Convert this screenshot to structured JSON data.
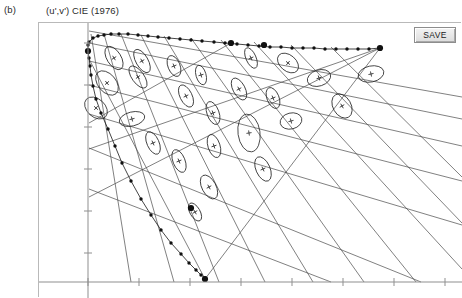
{
  "figure": {
    "panel_label": "(b)",
    "title": "(u',v') CIE (1976)"
  },
  "toolbar": {
    "save_label": "SAVE"
  },
  "colors": {
    "locus_line": "#151515",
    "locus_dot": "#101010",
    "grid_line": "#4a4a4a",
    "ellipse_line": "#2a2a2a",
    "axis_line": "#8f8f8f",
    "panel_border": "#b9b9b9",
    "background": "#ffffff"
  },
  "chart_data": {
    "type": "scatter",
    "title": "(u',v') CIE (1976)",
    "xlabel": "u'",
    "ylabel": "v'",
    "grid": true,
    "legend": null,
    "xlim": [
      0,
      1
    ],
    "ylim": [
      0,
      1
    ],
    "axes": {
      "x_axis_pixel_y": 281,
      "y_axis_pixel_x": 87,
      "x_ticks_pixel": [
        87,
        138,
        189,
        240,
        291,
        342,
        393,
        444
      ],
      "y_ticks_pixel": [
        42,
        84,
        126,
        168,
        210,
        252
      ],
      "tick_labels_visible": false
    },
    "spectral_locus": {
      "name": "Spectral locus (wavelength markers)",
      "marker": "filled-circle",
      "upper_branch_pixels": [
        [
          88,
          41
        ],
        [
          92,
          37
        ],
        [
          97,
          35
        ],
        [
          103,
          34
        ],
        [
          110,
          33
        ],
        [
          118,
          33
        ],
        [
          127,
          33
        ],
        [
          137,
          34
        ],
        [
          147,
          35
        ],
        [
          157,
          36
        ],
        [
          168,
          37
        ],
        [
          179,
          38
        ],
        [
          190,
          39
        ],
        [
          201,
          40
        ],
        [
          213,
          41
        ],
        [
          224,
          42
        ],
        [
          236,
          43
        ],
        [
          247,
          44
        ],
        [
          258,
          45
        ],
        [
          269,
          46
        ],
        [
          280,
          46
        ],
        [
          291,
          47
        ],
        [
          302,
          47
        ],
        [
          313,
          47
        ],
        [
          324,
          48
        ],
        [
          335,
          48
        ],
        [
          346,
          48
        ],
        [
          357,
          48
        ],
        [
          368,
          48
        ],
        [
          379,
          47
        ]
      ],
      "lower_branch_pixels": [
        [
          87,
          44
        ],
        [
          87,
          50
        ],
        [
          88,
          57
        ],
        [
          89,
          65
        ],
        [
          90,
          74
        ],
        [
          92,
          85
        ],
        [
          95,
          98
        ],
        [
          100,
          112
        ],
        [
          107,
          128
        ],
        [
          114,
          145
        ],
        [
          121,
          162
        ],
        [
          130,
          180
        ],
        [
          140,
          198
        ],
        [
          150,
          214
        ],
        [
          160,
          229
        ],
        [
          170,
          242
        ],
        [
          180,
          253
        ],
        [
          188,
          262
        ],
        [
          195,
          269
        ],
        [
          200,
          274
        ],
        [
          204,
          277
        ]
      ],
      "large_markers_pixels": [
        [
          87,
          50
        ],
        [
          230,
          42
        ],
        [
          263,
          44
        ],
        [
          379,
          47
        ],
        [
          204,
          278
        ],
        [
          190,
          207
        ]
      ]
    },
    "macadam_ellipses": {
      "name": "MacAdam ellipses (center + cross)",
      "count": 25,
      "items": [
        {
          "cx": 113,
          "cy": 57,
          "rx": 7,
          "ry": 13,
          "angle": -32
        },
        {
          "cx": 141,
          "cy": 60,
          "rx": 6,
          "ry": 13,
          "angle": -30
        },
        {
          "cx": 106,
          "cy": 82,
          "rx": 9,
          "ry": 14,
          "angle": -40
        },
        {
          "cx": 137,
          "cy": 76,
          "rx": 6,
          "ry": 13,
          "angle": -36
        },
        {
          "cx": 173,
          "cy": 65,
          "rx": 6,
          "ry": 11,
          "angle": -22
        },
        {
          "cx": 200,
          "cy": 74,
          "rx": 5,
          "ry": 10,
          "angle": -16
        },
        {
          "cx": 250,
          "cy": 57,
          "rx": 5,
          "ry": 11,
          "angle": -24
        },
        {
          "cx": 287,
          "cy": 62,
          "rx": 8,
          "ry": 12,
          "angle": -50
        },
        {
          "cx": 318,
          "cy": 77,
          "rx": 12,
          "ry": 8,
          "angle": -18
        },
        {
          "cx": 370,
          "cy": 73,
          "rx": 13,
          "ry": 8,
          "angle": -12
        },
        {
          "cx": 95,
          "cy": 107,
          "rx": 9,
          "ry": 13,
          "angle": -48
        },
        {
          "cx": 131,
          "cy": 118,
          "rx": 13,
          "ry": 7,
          "angle": -14
        },
        {
          "cx": 185,
          "cy": 95,
          "rx": 6,
          "ry": 12,
          "angle": -26
        },
        {
          "cx": 212,
          "cy": 112,
          "rx": 6,
          "ry": 12,
          "angle": -20
        },
        {
          "cx": 238,
          "cy": 88,
          "rx": 6,
          "ry": 12,
          "angle": -28
        },
        {
          "cx": 272,
          "cy": 97,
          "rx": 6,
          "ry": 11,
          "angle": -22
        },
        {
          "cx": 248,
          "cy": 132,
          "rx": 11,
          "ry": 19,
          "angle": -8
        },
        {
          "cx": 290,
          "cy": 120,
          "rx": 11,
          "ry": 8,
          "angle": -14
        },
        {
          "cx": 341,
          "cy": 105,
          "rx": 9,
          "ry": 13,
          "angle": -30
        },
        {
          "cx": 213,
          "cy": 145,
          "rx": 6,
          "ry": 12,
          "angle": -18
        },
        {
          "cx": 178,
          "cy": 160,
          "rx": 6,
          "ry": 12,
          "angle": -22
        },
        {
          "cx": 152,
          "cy": 142,
          "rx": 6,
          "ry": 12,
          "angle": -24
        },
        {
          "cx": 208,
          "cy": 186,
          "rx": 7,
          "ry": 13,
          "angle": -28
        },
        {
          "cx": 262,
          "cy": 168,
          "rx": 7,
          "ry": 13,
          "angle": -24
        },
        {
          "cx": 194,
          "cy": 211,
          "rx": 5,
          "ry": 10,
          "angle": -30
        }
      ]
    },
    "grid_lines": {
      "name": "Constant-hue / constant-saturation grid",
      "segments_pixels": [
        [
          [
            88,
            30
          ],
          [
            461,
            96
          ]
        ],
        [
          [
            88,
            42
          ],
          [
            461,
            118
          ]
        ],
        [
          [
            88,
            60
          ],
          [
            461,
            145
          ]
        ],
        [
          [
            88,
            84
          ],
          [
            461,
            180
          ]
        ],
        [
          [
            88,
            113
          ],
          [
            461,
            224
          ]
        ],
        [
          [
            88,
            147
          ],
          [
            420,
            281
          ]
        ],
        [
          [
            88,
            188
          ],
          [
            330,
            281
          ]
        ],
        [
          [
            90,
            33
          ],
          [
            130,
            281
          ]
        ],
        [
          [
            103,
            33
          ],
          [
            173,
            281
          ]
        ],
        [
          [
            120,
            33
          ],
          [
            218,
            281
          ]
        ],
        [
          [
            140,
            34
          ],
          [
            264,
            281
          ]
        ],
        [
          [
            163,
            35
          ],
          [
            312,
            281
          ]
        ],
        [
          [
            190,
            37
          ],
          [
            363,
            281
          ]
        ],
        [
          [
            220,
            39
          ],
          [
            415,
            281
          ]
        ],
        [
          [
            253,
            41
          ],
          [
            461,
            268
          ]
        ],
        [
          [
            290,
            44
          ],
          [
            461,
            222
          ]
        ],
        [
          [
            330,
            46
          ],
          [
            461,
            176
          ]
        ],
        [
          [
            379,
            47
          ],
          [
            88,
            148
          ]
        ],
        [
          [
            379,
            47
          ],
          [
            88,
            196
          ]
        ],
        [
          [
            379,
            47
          ],
          [
            204,
            278
          ]
        ],
        [
          [
            230,
            42
          ],
          [
            88,
            122
          ]
        ],
        [
          [
            204,
            278
          ],
          [
            88,
            58
          ]
        ]
      ]
    }
  }
}
